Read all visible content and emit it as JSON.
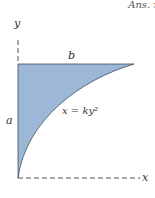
{
  "header": {
    "answer_fragment": "Ans. x"
  },
  "diagram": {
    "axes": {
      "x_label": "x",
      "y_label": "y"
    },
    "dimensions": {
      "width_label": "b",
      "height_label": "a"
    },
    "curve": {
      "equation": "x = ky²"
    },
    "colors": {
      "fill": "#9db8d6",
      "stroke": "#3a4a5a",
      "axis": "#555555"
    }
  }
}
